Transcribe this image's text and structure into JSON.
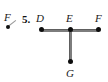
{
  "figure": {
    "problem_number": "5.",
    "background_color": "#ffffff",
    "node_color": "#0d0d0d",
    "line_color": "#7d7d7d",
    "label_color": "#1a1a1a"
  },
  "partial_figure": {
    "label": "F",
    "note": "cropped remnant of adjacent figure at left edge"
  },
  "diagram": {
    "type": "point-and-line geometry figure",
    "shape": "T",
    "vertices": [
      {
        "id": "D",
        "label": "D",
        "x": 42,
        "y": 30,
        "label_x": 36,
        "label_y": 13
      },
      {
        "id": "E",
        "label": "E",
        "x": 70,
        "y": 30,
        "label_x": 65,
        "label_y": 13
      },
      {
        "id": "F",
        "label": "F",
        "x": 99,
        "y": 30,
        "label_x": 94,
        "label_y": 13
      },
      {
        "id": "G",
        "label": "G",
        "x": 70,
        "y": 62,
        "label_x": 65,
        "label_y": 68
      }
    ],
    "segments": [
      {
        "id": "DF",
        "from": "D",
        "to": "F",
        "orientation": "horizontal"
      },
      {
        "id": "EG",
        "from": "E",
        "to": "G",
        "orientation": "vertical"
      }
    ]
  }
}
